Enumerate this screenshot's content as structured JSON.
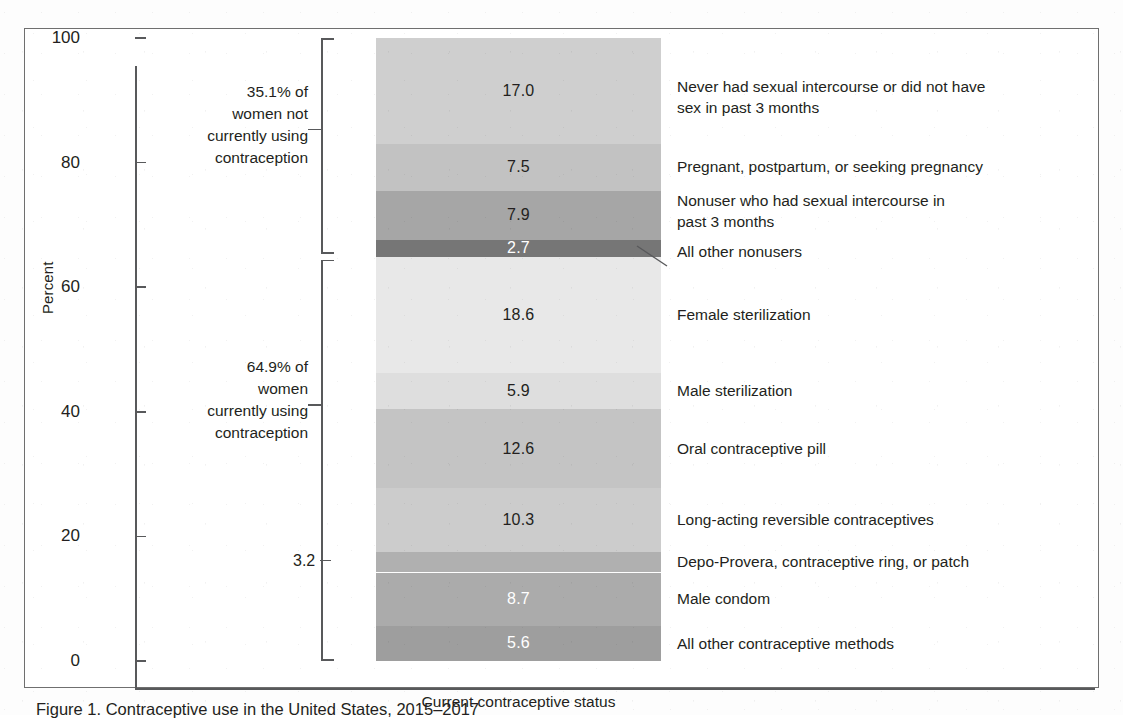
{
  "figure": {
    "caption": "Figure 1.  Contraceptive use in the United States, 2015–2017",
    "axis_label_y": "Percent",
    "axis_label_x": "Current contraceptive status"
  },
  "y_axis": {
    "ticks": [
      "100",
      "80",
      "60",
      "40",
      "20",
      "0"
    ],
    "values": [
      100,
      80,
      60,
      40,
      20,
      0
    ],
    "min": 0,
    "max": 100
  },
  "brackets": [
    {
      "id": "nonusers",
      "note_line1": "35.1% of",
      "note_line2": "women not",
      "note_line3": "currently using",
      "note_line4": "contraception",
      "total": "35.1"
    },
    {
      "id": "users",
      "note_line1": "64.9% of",
      "note_line2": "women",
      "note_line3": "currently using",
      "note_line4": "contraception",
      "total": "64.9"
    }
  ],
  "callouts": {
    "depo_value": "3.2"
  },
  "chart_data": {
    "type": "bar",
    "title": "Contraceptive use in the United States, 2015–2017",
    "subtitle": "",
    "xlabel": "Current contraceptive status",
    "ylabel": "Percent",
    "ylim": [
      0,
      100
    ],
    "grid": false,
    "legend": "right-of-bar category labels",
    "stacked": true,
    "categories": [
      "Current contraceptive status"
    ],
    "segments": [
      {
        "label": "Never had sexual intercourse or did not have sex in past 3 months",
        "label_line1": "Never had sexual intercourse or did not have",
        "label_line2": "sex in past 3 months",
        "value": 17.0,
        "value_text": "17.0",
        "color": "#cfcfcf",
        "text_color": "#231f20",
        "group": "nonusers"
      },
      {
        "label": "Pregnant, postpartum, or seeking pregnancy",
        "label_line1": "Pregnant, postpartum, or seeking pregnancy",
        "label_line2": "",
        "value": 7.5,
        "value_text": "7.5",
        "color": "#c2c2c2",
        "text_color": "#231f20",
        "group": "nonusers"
      },
      {
        "label": "Nonuser who had sexual intercourse in past 3 months",
        "label_line1": "Nonuser who had sexual intercourse in",
        "label_line2": "past 3 months",
        "value": 7.9,
        "value_text": "7.9",
        "color": "#a6a6a6",
        "text_color": "#231f20",
        "group": "nonusers"
      },
      {
        "label": "All other nonusers",
        "label_line1": "All other nonusers",
        "label_line2": "",
        "value": 2.7,
        "value_text": "2.7",
        "color": "#767676",
        "text_color": "#ffffff",
        "group": "nonusers"
      },
      {
        "label": "Female sterilization",
        "label_line1": "Female sterilization",
        "label_line2": "",
        "value": 18.6,
        "value_text": "18.6",
        "color": "#e8e8e8",
        "text_color": "#231f20",
        "group": "users"
      },
      {
        "label": "Male sterilization",
        "label_line1": "Male sterilization",
        "label_line2": "",
        "value": 5.9,
        "value_text": "5.9",
        "color": "#dedede",
        "text_color": "#231f20",
        "group": "users"
      },
      {
        "label": "Oral contraceptive pill",
        "label_line1": "Oral contraceptive pill",
        "label_line2": "",
        "value": 12.6,
        "value_text": "12.6",
        "color": "#c4c4c4",
        "text_color": "#231f20",
        "group": "users"
      },
      {
        "label": "Long-acting reversible contraceptives",
        "label_line1": "Long-acting reversible contraceptives",
        "label_line2": "",
        "value": 10.3,
        "value_text": "10.3",
        "color": "#cccccc",
        "text_color": "#231f20",
        "group": "users"
      },
      {
        "label": "Depo-Provera, contraceptive ring, or patch",
        "label_line1": "Depo-Provera, contraceptive ring, or patch",
        "label_line2": "",
        "value": 3.2,
        "value_text": "3.2",
        "color": "#b0b0b0",
        "text_color": "#231f20",
        "group": "users",
        "label_outside": true
      },
      {
        "label": "Male condom",
        "label_line1": "Male condom",
        "label_line2": "",
        "value": 8.7,
        "value_text": "8.7",
        "color": "#ababab",
        "text_color": "#ffffff",
        "group": "users"
      },
      {
        "label": "All other contraceptive methods",
        "label_line1": "All other contraceptive methods",
        "label_line2": "",
        "value": 5.6,
        "value_text": "5.6",
        "color": "#9e9e9e",
        "text_color": "#ffffff",
        "group": "users"
      }
    ]
  }
}
